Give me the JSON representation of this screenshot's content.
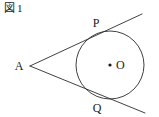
{
  "caption": {
    "figure_word": "図",
    "figure_number": "1",
    "full": "図1"
  },
  "colors": {
    "stroke": "#2b2b2b",
    "label": "#1a1a1a",
    "background": "#ffffff"
  },
  "figure": {
    "type": "geometry-diagram",
    "circle": {
      "center_label": "O",
      "center_x": 110,
      "center_y": 65,
      "radius": 34,
      "center_dot": true
    },
    "points": [
      {
        "id": "A",
        "label": "A",
        "x": 30,
        "y": 66,
        "label_x": 19,
        "label_y": 70
      },
      {
        "id": "P",
        "label": "P",
        "x": 101,
        "y": 33,
        "label_x": 95,
        "label_y": 26
      },
      {
        "id": "Q",
        "label": "Q",
        "x": 101,
        "y": 98,
        "label_x": 95,
        "label_y": 112
      },
      {
        "id": "O",
        "label": "O",
        "x": 110,
        "y": 65,
        "label_x": 116,
        "label_y": 69
      }
    ],
    "lines": [
      {
        "id": "tangent-upper",
        "from_x": 30,
        "from_y": 66,
        "to_x": 142,
        "to_y": 14
      },
      {
        "id": "tangent-lower",
        "from_x": 30,
        "from_y": 66,
        "to_x": 145,
        "to_y": 113
      }
    ]
  }
}
